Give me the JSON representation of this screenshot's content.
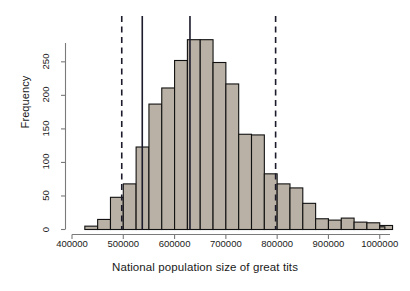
{
  "figure": {
    "background_color": "#ffffff",
    "bar_fill_color": "#b9b1a5",
    "bar_edge_color": "#111111",
    "line_color": "#1b1b2b",
    "axis_color": "#7a7a7a"
  },
  "axes": {
    "y_title": "Frequency",
    "x_title": "National population size of great tits",
    "y_ticks": [
      {
        "value": 0,
        "label": "0"
      },
      {
        "value": 50,
        "label": "50"
      },
      {
        "value": 100,
        "label": "100"
      },
      {
        "value": 150,
        "label": "150"
      },
      {
        "value": 200,
        "label": "200"
      },
      {
        "value": 250,
        "label": "250"
      }
    ],
    "x_ticks": [
      {
        "value": 400000,
        "label": "400000"
      },
      {
        "value": 500000,
        "label": "500000"
      },
      {
        "value": 600000,
        "label": "600000"
      },
      {
        "value": 700000,
        "label": "700000"
      },
      {
        "value": 800000,
        "label": "800000"
      },
      {
        "value": 900000,
        "label": "900000"
      },
      {
        "value": 1000000,
        "label": "1000000"
      }
    ]
  },
  "chart_data": {
    "type": "bar",
    "title": "",
    "subtitle": "",
    "xlabel": "National population size of great tits",
    "ylabel": "Frequency",
    "xlim": [
      400000,
      1020000
    ],
    "ylim": [
      0,
      290
    ],
    "grid": false,
    "legend": "none",
    "bin_width": 25000,
    "bin_edges": [
      425000,
      450000,
      475000,
      500000,
      525000,
      550000,
      575000,
      600000,
      625000,
      650000,
      675000,
      700000,
      725000,
      750000,
      775000,
      800000,
      825000,
      850000,
      875000,
      900000,
      925000,
      950000,
      975000,
      1000000,
      1025000
    ],
    "categories": [
      "425000-450000",
      "450000-475000",
      "475000-500000",
      "500000-525000",
      "525000-550000",
      "550000-575000",
      "575000-600000",
      "600000-625000",
      "625000-650000",
      "650000-675000",
      "675000-700000",
      "700000-725000",
      "725000-750000",
      "750000-775000",
      "775000-800000",
      "800000-825000",
      "825000-850000",
      "850000-875000",
      "875000-900000",
      "900000-925000",
      "925000-950000",
      "950000-975000",
      "975000-1000000",
      "1000000-1025000"
    ],
    "values": [
      5,
      15,
      48,
      68,
      123,
      187,
      211,
      252,
      283,
      283,
      249,
      217,
      142,
      141,
      83,
      68,
      62,
      39,
      16,
      14,
      17,
      11,
      10,
      6
    ],
    "extra_tail_bins": {
      "edges": [
        1000000,
        1010000
      ],
      "values": [
        4
      ]
    },
    "annotations": [
      {
        "name": "lower-confidence-line",
        "type": "vline",
        "x": 497000,
        "style": "dashed",
        "label": ""
      },
      {
        "name": "lower-reference-line",
        "type": "vline",
        "x": 537000,
        "style": "solid",
        "label": ""
      },
      {
        "name": "mean-reference-line",
        "type": "vline",
        "x": 630000,
        "style": "solid",
        "label": ""
      },
      {
        "name": "upper-confidence-line",
        "type": "vline",
        "x": 797000,
        "style": "dashed",
        "label": ""
      }
    ]
  }
}
